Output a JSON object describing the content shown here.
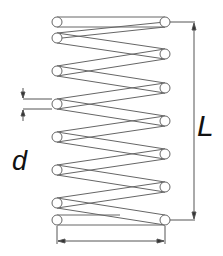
{
  "diagram": {
    "type": "compression spring schematic",
    "labels": {
      "length": "L",
      "wire_diameter": "d"
    },
    "colors": {
      "stroke": "#555555",
      "text": "#111111",
      "background": "#ffffff"
    },
    "dimensions": [
      {
        "name": "free-length",
        "label": "L",
        "orientation": "vertical"
      },
      {
        "name": "wire-diameter",
        "label": "d",
        "orientation": "vertical"
      },
      {
        "name": "coil-diameter",
        "label": "",
        "orientation": "horizontal"
      }
    ]
  }
}
